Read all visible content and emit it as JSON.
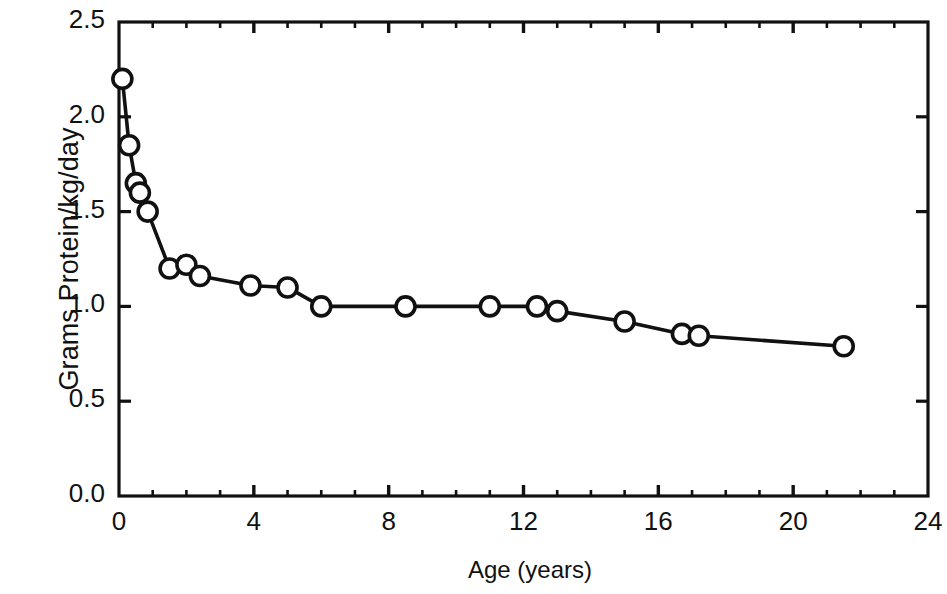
{
  "chart_data": {
    "type": "line",
    "title": "",
    "subtitle": "",
    "xlabel": "Age (years)",
    "ylabel": "Grams Protein/kg/day",
    "xlim": [
      0,
      24
    ],
    "ylim": [
      0.0,
      2.5
    ],
    "xticks": [
      0,
      4,
      8,
      12,
      16,
      20,
      24
    ],
    "xtick_labels": [
      "0",
      "4",
      "8",
      "12",
      "16",
      "20",
      "24"
    ],
    "xminor_tick_interval": 1,
    "yticks": [
      0.0,
      0.5,
      1.0,
      1.5,
      2.0,
      2.5
    ],
    "ytick_labels": [
      "0.0",
      "0.5",
      "1.0",
      "1.5",
      "2.0",
      "2.5"
    ],
    "grid": false,
    "legend": null,
    "legend_position": "none",
    "marker": "open-circle",
    "line_color": "#111111",
    "marker_face_color": "#ffffff",
    "marker_edge_color": "#111111",
    "frame": "box-all-four-sides",
    "series": [
      {
        "name": "Protein requirement",
        "x": [
          0.1,
          0.3,
          0.5,
          0.62,
          0.85,
          1.5,
          2.0,
          2.4,
          3.9,
          5.0,
          6.0,
          8.5,
          11.0,
          12.4,
          13.0,
          15.0,
          16.7,
          17.2,
          21.5
        ],
        "y": [
          2.2,
          1.85,
          1.65,
          1.6,
          1.5,
          1.2,
          1.22,
          1.16,
          1.11,
          1.1,
          1.0,
          1.0,
          1.0,
          1.0,
          0.975,
          0.92,
          0.855,
          0.845,
          0.79
        ]
      }
    ]
  }
}
